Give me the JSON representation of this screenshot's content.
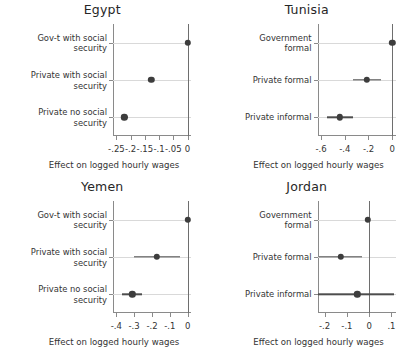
{
  "figure": {
    "type": "multi-panel-coefficient-plot",
    "panels_layout": "2x2",
    "xlabel_common": "Effect on logged hourly wages"
  },
  "chart_data": [
    {
      "type": "scatter",
      "title": "Egypt",
      "xlabel": "Effect on logged hourly wages",
      "ylabel": "",
      "xlim": [
        -0.262,
        0.012
      ],
      "xticks": [
        -0.25,
        -0.2,
        -0.15,
        -0.1,
        -0.05,
        0
      ],
      "xticklabels": [
        "-.25",
        "-.2",
        "-.15",
        "-.1",
        "-.05",
        "0"
      ],
      "grid": false,
      "legend": "none",
      "categories": [
        "Gov-t with social\nsecurity",
        "Private with social\nsecurity",
        "Private no social\nsecurity"
      ],
      "values": [
        0.0,
        -0.128,
        -0.222
      ],
      "ci_low": [
        0.0,
        -0.138,
        -0.233
      ],
      "ci_high": [
        0.0,
        -0.118,
        -0.211
      ]
    },
    {
      "type": "scatter",
      "title": "Tunisia",
      "xlabel": "Effect on logged hourly wages",
      "ylabel": "",
      "xlim": [
        -0.63,
        0.028
      ],
      "xticks": [
        -0.6,
        -0.4,
        -0.2,
        0
      ],
      "xticklabels": [
        "-.6",
        "-.4",
        "-.2",
        "0"
      ],
      "grid": false,
      "legend": "none",
      "categories": [
        "Government\nformal",
        "Private formal",
        "Private informal"
      ],
      "values": [
        0.0,
        -0.212,
        -0.44
      ],
      "ci_low": [
        0.0,
        -0.332,
        -0.553
      ],
      "ci_high": [
        0.0,
        -0.092,
        -0.329
      ]
    },
    {
      "type": "scatter",
      "title": "Yemen",
      "xlabel": "Effect on logged hourly wages",
      "ylabel": "",
      "xlim": [
        -0.418,
        0.018
      ],
      "xticks": [
        -0.4,
        -0.3,
        -0.2,
        -0.1,
        0
      ],
      "xticklabels": [
        "-.4",
        "-.3",
        "-.2",
        "-.1",
        "0"
      ],
      "grid": false,
      "legend": "none",
      "categories": [
        "Gov-t with social\nsecurity",
        "Private with social\nsecurity",
        "Private no social\nsecurity"
      ],
      "values": [
        0.0,
        -0.172,
        -0.311
      ],
      "ci_low": [
        0.0,
        -0.299,
        -0.366
      ],
      "ci_high": [
        0.0,
        -0.046,
        -0.256
      ]
    },
    {
      "type": "scatter",
      "title": "Jordan",
      "xlabel": "Effect on logged hourly wages",
      "ylabel": "",
      "xlim": [
        -0.232,
        0.118
      ],
      "xticks": [
        -0.2,
        -0.1,
        0,
        0.1
      ],
      "xticklabels": [
        "-.2",
        "-.1",
        "0",
        ".1"
      ],
      "grid": false,
      "legend": "none",
      "categories": [
        "Government\nformal",
        "Private formal",
        "Private informal"
      ],
      "values": [
        -0.005,
        -0.128,
        -0.053
      ],
      "ci_low": [
        -0.005,
        -0.225,
        -0.228
      ],
      "ci_high": [
        -0.005,
        -0.034,
        0.112
      ]
    }
  ]
}
